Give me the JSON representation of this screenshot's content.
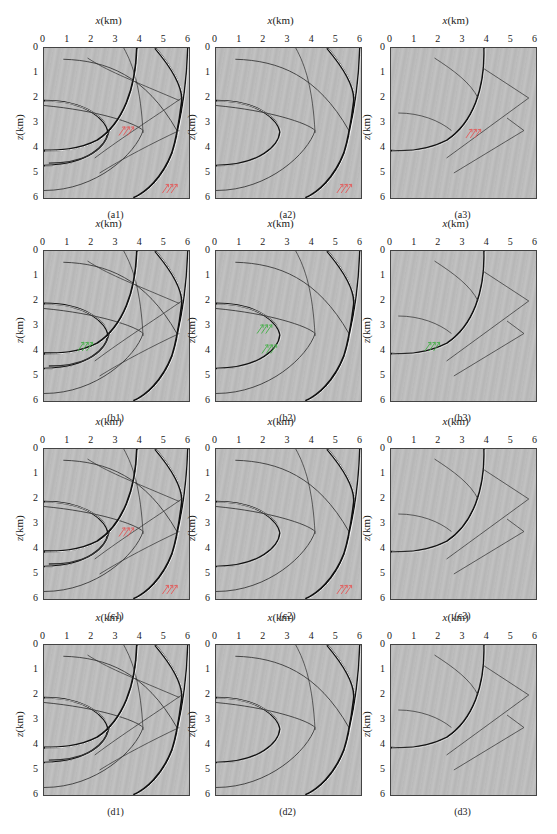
{
  "figure": {
    "axis": {
      "x_label_var": "x",
      "x_label_unit": "(km)",
      "z_label_var": "z",
      "z_label_unit": "(km)",
      "x_ticks": [
        "0",
        "1",
        "2",
        "3",
        "4",
        "5",
        "6"
      ],
      "z_ticks": [
        "0",
        "1",
        "2",
        "3",
        "4",
        "5",
        "6"
      ]
    },
    "annotation_colors": {
      "red_arrows": "#e06060",
      "green_arrows": "#4caf50"
    },
    "panels": [
      {
        "id": "a1",
        "caption": "(a1)",
        "type": "full",
        "arrows": "red"
      },
      {
        "id": "a2",
        "caption": "(a2)",
        "type": "single",
        "arrows": "red"
      },
      {
        "id": "a3",
        "caption": "(a3)",
        "type": "thin",
        "arrows": "red"
      },
      {
        "id": "b1",
        "caption": "(b1)",
        "type": "full",
        "arrows": "green"
      },
      {
        "id": "b2",
        "caption": "(b2)",
        "type": "single",
        "arrows": "green"
      },
      {
        "id": "b3",
        "caption": "(b3)",
        "type": "thin",
        "arrows": "green"
      },
      {
        "id": "c1",
        "caption": "(c1)",
        "type": "full",
        "arrows": "red"
      },
      {
        "id": "c2",
        "caption": "(c2)",
        "type": "single",
        "arrows": "red"
      },
      {
        "id": "c3",
        "caption": "(c3)",
        "type": "thin",
        "arrows": "none"
      },
      {
        "id": "d1",
        "caption": "(d1)",
        "type": "full",
        "arrows": "none"
      },
      {
        "id": "d2",
        "caption": "(d2)",
        "type": "single",
        "arrows": "none"
      },
      {
        "id": "d3",
        "caption": "(d3)",
        "type": "thin",
        "arrows": "none"
      }
    ]
  }
}
